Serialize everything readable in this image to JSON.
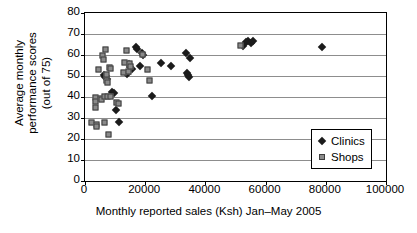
{
  "chart_data": {
    "type": "scatter",
    "title": "",
    "xlabel": "Monthly reported sales (Ksh) Jan–May 2005",
    "ylabel_lines": [
      "Average monthly",
      "performance scores",
      "(out of 75)"
    ],
    "ylabel": "Average monthly performance scores (out of 75)",
    "xlim": [
      0,
      100000
    ],
    "ylim": [
      0,
      80
    ],
    "xticks": [
      0,
      20000,
      40000,
      60000,
      80000,
      100000
    ],
    "xticklabels": [
      "0",
      "20000",
      "40000",
      "60000",
      "80000",
      "100000"
    ],
    "yticks": [
      0,
      10,
      20,
      30,
      40,
      50,
      60,
      70,
      80
    ],
    "yticklabels": [
      "0",
      "10",
      "20",
      "30",
      "40",
      "50",
      "60",
      "70",
      "80"
    ],
    "grid": "horizontal",
    "legend_position": "lower-right-inside",
    "series": [
      {
        "name": "Clinics",
        "marker": "diamond",
        "color": "#1b1b1b",
        "points": [
          [
            6200,
            50.5
          ],
          [
            6600,
            49.5
          ],
          [
            7100,
            50.0
          ],
          [
            7400,
            48.5
          ],
          [
            9100,
            42.5
          ],
          [
            9600,
            42.0
          ],
          [
            10400,
            34.0
          ],
          [
            11200,
            28.0
          ],
          [
            13900,
            51.0
          ],
          [
            14700,
            55.5
          ],
          [
            15100,
            54.5
          ],
          [
            15600,
            53.5
          ],
          [
            16900,
            64.0
          ],
          [
            17300,
            63.0
          ],
          [
            18300,
            55.0
          ],
          [
            18900,
            61.0
          ],
          [
            19400,
            60.0
          ],
          [
            22300,
            40.3
          ],
          [
            25400,
            56.0
          ],
          [
            28700,
            55.0
          ],
          [
            33600,
            61.0
          ],
          [
            33900,
            51.5
          ],
          [
            34200,
            50.5
          ],
          [
            34600,
            49.5
          ],
          [
            35000,
            58.5
          ],
          [
            52400,
            64.5
          ],
          [
            53600,
            66.0
          ],
          [
            54300,
            66.5
          ],
          [
            55200,
            65.5
          ],
          [
            55900,
            66.5
          ],
          [
            78600,
            64.0
          ]
        ]
      },
      {
        "name": "Shops",
        "marker": "square",
        "color": "#8a8a8a",
        "points": [
          [
            2300,
            27.5
          ],
          [
            3600,
            39.5
          ],
          [
            3700,
            37.5
          ],
          [
            3800,
            35.0
          ],
          [
            4000,
            26.5
          ],
          [
            4100,
            25.5
          ],
          [
            4600,
            53.0
          ],
          [
            5200,
            39.0
          ],
          [
            5500,
            38.5
          ],
          [
            6100,
            59.5
          ],
          [
            6300,
            57.5
          ],
          [
            6500,
            40.0
          ],
          [
            6800,
            27.5
          ],
          [
            7100,
            62.5
          ],
          [
            7200,
            50.5
          ],
          [
            7400,
            47.5
          ],
          [
            7600,
            46.5
          ],
          [
            7800,
            40.0
          ],
          [
            7900,
            22.0
          ],
          [
            8300,
            54.0
          ],
          [
            8500,
            53.5
          ],
          [
            8800,
            40.0
          ],
          [
            10700,
            37.0
          ],
          [
            11400,
            36.8
          ],
          [
            13000,
            51.5
          ],
          [
            13400,
            56.0
          ],
          [
            14100,
            62.0
          ],
          [
            14600,
            52.0
          ],
          [
            14900,
            55.5
          ],
          [
            15200,
            54.5
          ],
          [
            19200,
            60.0
          ],
          [
            20900,
            53.0
          ],
          [
            21700,
            47.5
          ],
          [
            51800,
            64.5
          ]
        ]
      }
    ]
  },
  "legend": {
    "entries": [
      {
        "label": "Clinics",
        "marker": "diamond-icon"
      },
      {
        "label": "Shops",
        "marker": "square-icon"
      }
    ]
  }
}
